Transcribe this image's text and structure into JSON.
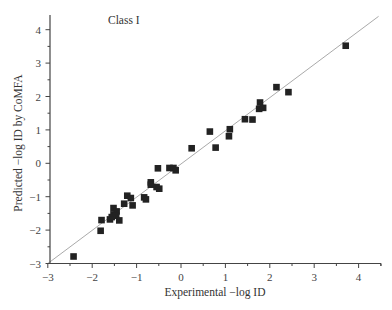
{
  "chart_data": {
    "type": "scatter",
    "title": "Class I",
    "xlabel": "Experimental −log ID",
    "ylabel": "Predicted −log ID by CoMFA",
    "xlim": [
      -3,
      4.5
    ],
    "ylim": [
      -3,
      4.4
    ],
    "xticks": [
      -3,
      -2,
      -1,
      0,
      1,
      2,
      3,
      4
    ],
    "yticks": [
      -3,
      -2,
      -1,
      0,
      1,
      2,
      3,
      4
    ],
    "xtick_labels": [
      "−3",
      "−2",
      "−1",
      "0",
      "1",
      "2",
      "3",
      "4"
    ],
    "ytick_labels": [
      "−3",
      "−2",
      "−1",
      "0",
      "1",
      "2",
      "3",
      "4"
    ],
    "grid": false,
    "legend": null,
    "fit_line": {
      "x": [
        -3,
        4.45
      ],
      "y": [
        -3,
        4.4
      ],
      "color": "#aaaaaa"
    },
    "marker": {
      "shape": "square",
      "color": "#222222"
    },
    "series": [
      {
        "name": "Class I",
        "points": [
          {
            "x": 3.71,
            "y": 3.52
          },
          {
            "x": 2.15,
            "y": 2.28
          },
          {
            "x": 2.42,
            "y": 2.13
          },
          {
            "x": 1.78,
            "y": 1.82
          },
          {
            "x": 1.76,
            "y": 1.63
          },
          {
            "x": 1.85,
            "y": 1.66
          },
          {
            "x": 1.44,
            "y": 1.32
          },
          {
            "x": 1.61,
            "y": 1.31
          },
          {
            "x": 0.65,
            "y": 0.95
          },
          {
            "x": 1.1,
            "y": 1.02
          },
          {
            "x": 1.08,
            "y": 0.81
          },
          {
            "x": 0.24,
            "y": 0.45
          },
          {
            "x": 0.78,
            "y": 0.47
          },
          {
            "x": -0.52,
            "y": -0.15
          },
          {
            "x": -0.26,
            "y": -0.14
          },
          {
            "x": -0.17,
            "y": -0.14
          },
          {
            "x": -0.12,
            "y": -0.21
          },
          {
            "x": -0.68,
            "y": -0.57
          },
          {
            "x": -0.68,
            "y": -0.64
          },
          {
            "x": -0.55,
            "y": -0.71
          },
          {
            "x": -0.49,
            "y": -0.76
          },
          {
            "x": -1.21,
            "y": -0.97
          },
          {
            "x": -1.13,
            "y": -1.04
          },
          {
            "x": -0.83,
            "y": -1.02
          },
          {
            "x": -0.79,
            "y": -1.08
          },
          {
            "x": -1.28,
            "y": -1.21
          },
          {
            "x": -1.09,
            "y": -1.26
          },
          {
            "x": -1.52,
            "y": -1.34
          },
          {
            "x": -1.45,
            "y": -1.44
          },
          {
            "x": -1.52,
            "y": -1.53
          },
          {
            "x": -1.56,
            "y": -1.61
          },
          {
            "x": -1.46,
            "y": -1.57
          },
          {
            "x": -1.6,
            "y": -1.68
          },
          {
            "x": -1.39,
            "y": -1.71
          },
          {
            "x": -1.79,
            "y": -1.7
          },
          {
            "x": -1.81,
            "y": -2.02
          },
          {
            "x": -2.42,
            "y": -2.79
          }
        ]
      }
    ]
  }
}
